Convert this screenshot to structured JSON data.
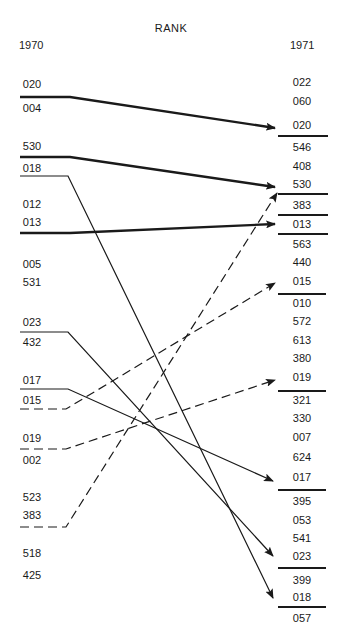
{
  "chart_data": {
    "type": "table",
    "title": "RANK",
    "columns": [
      "1970",
      "1971"
    ],
    "left_ranking_1970": [
      "020",
      "004",
      "530",
      "018",
      "012",
      "013",
      "005",
      "531",
      "023",
      "432",
      "017",
      "015",
      "019",
      "002",
      "523",
      "383",
      "518",
      "425"
    ],
    "right_ranking_1971": [
      "022",
      "060",
      "020",
      "546",
      "408",
      "530",
      "383",
      "013",
      "563",
      "440",
      "015",
      "010",
      "572",
      "613",
      "380",
      "019",
      "321",
      "330",
      "007",
      "624",
      "017",
      "395",
      "053",
      "541",
      "023",
      "399",
      "018",
      "057"
    ],
    "movements": [
      {
        "item": "020",
        "from_rank_1970": 1,
        "to_rank_1971": 3,
        "style": "thick-solid"
      },
      {
        "item": "530",
        "from_rank_1970": 3,
        "to_rank_1971": 6,
        "style": "thick-solid"
      },
      {
        "item": "013",
        "from_rank_1970": 6,
        "to_rank_1971": 8,
        "style": "thick-solid"
      },
      {
        "item": "018",
        "from_rank_1970": 4,
        "to_rank_1971": 27,
        "style": "solid"
      },
      {
        "item": "023",
        "from_rank_1970": 9,
        "to_rank_1971": 25,
        "style": "solid"
      },
      {
        "item": "017",
        "from_rank_1970": 11,
        "to_rank_1971": 21,
        "style": "solid"
      },
      {
        "item": "015",
        "from_rank_1970": 12,
        "to_rank_1971": 11,
        "style": "dashed"
      },
      {
        "item": "019",
        "from_rank_1970": 13,
        "to_rank_1971": 16,
        "style": "dashed"
      },
      {
        "item": "383",
        "from_rank_1970": 16,
        "to_rank_1971": 7,
        "style": "dashed"
      }
    ]
  },
  "header": {
    "title": "RANK",
    "left_year": "1970",
    "right_year": "1971"
  },
  "left": [
    {
      "code": "020",
      "y": 78
    },
    {
      "code": "004",
      "y": 102
    },
    {
      "code": "530",
      "y": 140
    },
    {
      "code": "018",
      "y": 162
    },
    {
      "code": "012",
      "y": 198
    },
    {
      "code": "013",
      "y": 216
    },
    {
      "code": "005",
      "y": 258
    },
    {
      "code": "531",
      "y": 276
    },
    {
      "code": "023",
      "y": 316
    },
    {
      "code": "432",
      "y": 336
    },
    {
      "code": "017",
      "y": 374
    },
    {
      "code": "015",
      "y": 394
    },
    {
      "code": "019",
      "y": 432
    },
    {
      "code": "002",
      "y": 454
    },
    {
      "code": "523",
      "y": 491
    },
    {
      "code": "383",
      "y": 509
    },
    {
      "code": "518",
      "y": 547
    },
    {
      "code": "425",
      "y": 569
    }
  ],
  "right": [
    {
      "code": "022",
      "y": 76
    },
    {
      "code": "060",
      "y": 95
    },
    {
      "code": "020",
      "y": 119
    },
    {
      "code": "546",
      "y": 141
    },
    {
      "code": "408",
      "y": 160
    },
    {
      "code": "530",
      "y": 178
    },
    {
      "code": "383",
      "y": 199
    },
    {
      "code": "013",
      "y": 218
    },
    {
      "code": "563",
      "y": 238
    },
    {
      "code": "440",
      "y": 256
    },
    {
      "code": "015",
      "y": 275
    },
    {
      "code": "010",
      "y": 297
    },
    {
      "code": "572",
      "y": 315
    },
    {
      "code": "613",
      "y": 334
    },
    {
      "code": "380",
      "y": 352
    },
    {
      "code": "019",
      "y": 371
    },
    {
      "code": "321",
      "y": 394
    },
    {
      "code": "330",
      "y": 412
    },
    {
      "code": "007",
      "y": 431
    },
    {
      "code": "624",
      "y": 451
    },
    {
      "code": "017",
      "y": 471
    },
    {
      "code": "395",
      "y": 495
    },
    {
      "code": "053",
      "y": 514
    },
    {
      "code": "541",
      "y": 532
    },
    {
      "code": "023",
      "y": 550
    },
    {
      "code": "399",
      "y": 574
    },
    {
      "code": "018",
      "y": 591
    },
    {
      "code": "057",
      "y": 612
    }
  ]
}
